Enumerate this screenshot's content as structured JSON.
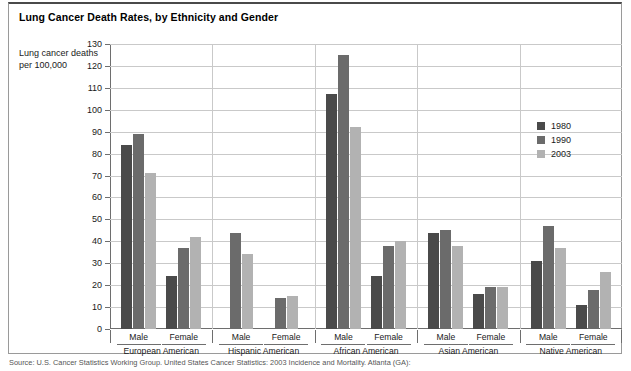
{
  "figure": {
    "title": "Lung Cancer Death Rates, by Ethnicity and Gender",
    "y_caption": "Lung cancer deaths per 100,000",
    "source": "Source: U.S. Cancer Statistics Working Group. United States Cancer Statistics: 2003 Incidence and Mortality. Atlanta (GA):"
  },
  "legend": {
    "position": "right-inside",
    "entries": [
      {
        "label": "1980",
        "color": "#4a4a4a"
      },
      {
        "label": "1990",
        "color": "#6b6b6b"
      },
      {
        "label": "2003",
        "color": "#b2b2b2"
      }
    ]
  },
  "chart_data": {
    "type": "bar",
    "title": "Lung Cancer Death Rates, by Ethnicity and Gender",
    "xlabel": "",
    "ylabel": "Lung cancer deaths per 100,000",
    "ylim": [
      0,
      130
    ],
    "ytick_step": 10,
    "yticks": [
      0,
      10,
      20,
      30,
      40,
      50,
      60,
      70,
      80,
      90,
      100,
      110,
      120,
      130
    ],
    "ytick_labels": [
      "0",
      "10",
      "20",
      "30",
      "40",
      "50",
      "60",
      "70",
      "80",
      "90",
      "100",
      "110",
      "120",
      "130"
    ],
    "grid": true,
    "ethnicities": [
      "European American",
      "Hispanic American",
      "African American",
      "Asian American",
      "Native American"
    ],
    "genders": [
      "Male",
      "Female"
    ],
    "categories": [
      "European American Male",
      "European American Female",
      "Hispanic American Male",
      "Hispanic American Female",
      "African American Male",
      "African American Female",
      "Asian American Male",
      "Asian American Female",
      "Native American Male",
      "Native American Female"
    ],
    "series": [
      {
        "name": "1980",
        "color": "#4a4a4a",
        "values": [
          84,
          24,
          null,
          null,
          107,
          24,
          44,
          16,
          31,
          11
        ]
      },
      {
        "name": "1990",
        "color": "#6b6b6b",
        "values": [
          89,
          37,
          44,
          14,
          125,
          38,
          45,
          19,
          47,
          18
        ]
      },
      {
        "name": "2003",
        "color": "#b2b2b2",
        "values": [
          71,
          42,
          34,
          15,
          92,
          40,
          38,
          19,
          37,
          26
        ]
      }
    ],
    "groups": [
      {
        "ethnicity": "European American",
        "male": {
          "1980": 84,
          "1990": 89,
          "2003": 71
        },
        "female": {
          "1980": 24,
          "1990": 37,
          "2003": 42
        }
      },
      {
        "ethnicity": "Hispanic American",
        "male": {
          "1980": null,
          "1990": 44,
          "2003": 34
        },
        "female": {
          "1980": null,
          "1990": 14,
          "2003": 15
        }
      },
      {
        "ethnicity": "African American",
        "male": {
          "1980": 107,
          "1990": 125,
          "2003": 92
        },
        "female": {
          "1980": 24,
          "1990": 38,
          "2003": 40
        }
      },
      {
        "ethnicity": "Asian American",
        "male": {
          "1980": 44,
          "1990": 45,
          "2003": 38
        },
        "female": {
          "1980": 16,
          "1990": 19,
          "2003": 19
        }
      },
      {
        "ethnicity": "Native American",
        "male": {
          "1980": 31,
          "1990": 47,
          "2003": 37
        },
        "female": {
          "1980": 11,
          "1990": 18,
          "2003": 26
        }
      }
    ]
  }
}
